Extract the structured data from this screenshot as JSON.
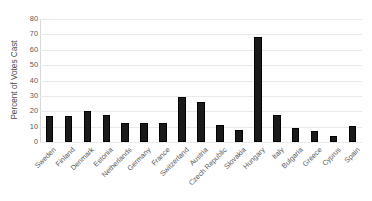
{
  "chart_data": {
    "type": "bar",
    "title": "",
    "xlabel": "",
    "ylabel": "Percent of Votes Cast",
    "ylim": [
      0,
      80
    ],
    "ytick_step": 10,
    "yticks": [
      0,
      10,
      20,
      30,
      40,
      50,
      60,
      70,
      80
    ],
    "grid": true,
    "legend": "none",
    "bar_color": "#1a1a1a",
    "categories": [
      "Sweden",
      "Finland",
      "Denmark",
      "Estonia",
      "Netherlands",
      "Germany",
      "France",
      "Switzerland",
      "Austria",
      "Czech Republic",
      "Slovakia",
      "Hungary",
      "Italy",
      "Bulgaria",
      "Greece",
      "Cyprus",
      "Spain"
    ],
    "values": [
      17,
      17,
      20,
      17.5,
      12.5,
      12.5,
      12.5,
      29,
      26,
      11,
      8,
      68,
      17.5,
      9,
      7,
      4,
      10.5
    ]
  }
}
